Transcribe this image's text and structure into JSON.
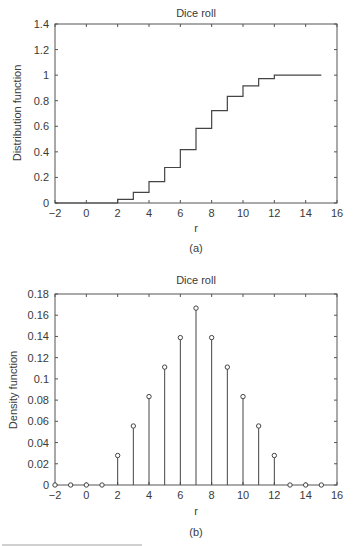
{
  "chart_data": [
    {
      "type": "line",
      "subtype": "step",
      "panel_label": "(a)",
      "title": "Dice roll",
      "xlabel": "r",
      "ylabel": "Distribution function",
      "xlim": [
        -2,
        16
      ],
      "ylim": [
        0,
        1.4
      ],
      "xticks": [
        -2,
        0,
        2,
        4,
        6,
        8,
        10,
        12,
        14,
        16
      ],
      "yticks": [
        0,
        0.2,
        0.4,
        0.6,
        0.8,
        1,
        1.2,
        1.4
      ],
      "xtick_labels": [
        "−2",
        "0",
        "2",
        "4",
        "6",
        "8",
        "10",
        "12",
        "14",
        "16"
      ],
      "ytick_labels": [
        "0",
        "0.2",
        "0.4",
        "0.6",
        "0.8",
        "1",
        "1.2",
        "1.4"
      ],
      "grid": false,
      "x": [
        -2,
        -1,
        0,
        1,
        2,
        3,
        4,
        5,
        6,
        7,
        8,
        9,
        10,
        11,
        12,
        13,
        14,
        15
      ],
      "values": [
        0,
        0,
        0,
        0,
        0.0278,
        0.0833,
        0.1667,
        0.2778,
        0.4167,
        0.5833,
        0.7222,
        0.8333,
        0.9167,
        0.9722,
        1.0,
        1.0,
        1.0,
        1.0
      ]
    },
    {
      "type": "stem",
      "panel_label": "(b)",
      "title": "Dice roll",
      "xlabel": "r",
      "ylabel": "Density function",
      "xlim": [
        -2,
        16
      ],
      "ylim": [
        0,
        0.18
      ],
      "xticks": [
        -2,
        0,
        2,
        4,
        6,
        8,
        10,
        12,
        14,
        16
      ],
      "yticks": [
        0,
        0.02,
        0.04,
        0.06,
        0.08,
        0.1,
        0.12,
        0.14,
        0.16,
        0.18
      ],
      "xtick_labels": [
        "−2",
        "0",
        "2",
        "4",
        "6",
        "8",
        "10",
        "12",
        "14",
        "16"
      ],
      "ytick_labels": [
        "0",
        "0.02",
        "0.04",
        "0.06",
        "0.08",
        "0.1",
        "0.12",
        "0.14",
        "0.16",
        "0.18"
      ],
      "grid": false,
      "x": [
        -2,
        -1,
        0,
        1,
        2,
        3,
        4,
        5,
        6,
        7,
        8,
        9,
        10,
        11,
        12,
        13,
        14,
        15
      ],
      "values": [
        0,
        0,
        0,
        0,
        0.0278,
        0.0556,
        0.0833,
        0.1111,
        0.1389,
        0.1667,
        0.1389,
        0.1111,
        0.0833,
        0.0556,
        0.0278,
        0,
        0,
        0
      ]
    }
  ],
  "colors": {
    "line": "#444444",
    "axis": "#555555",
    "text": "#3a3a3a"
  }
}
